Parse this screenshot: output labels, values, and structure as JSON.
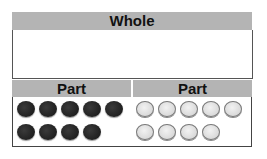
{
  "whole": {
    "label": "Whole"
  },
  "parts": [
    {
      "label": "Part",
      "counter_color": "dark",
      "count": 9
    },
    {
      "label": "Part",
      "counter_color": "light",
      "count": 9
    }
  ],
  "colors": {
    "header": "#b4b4b4",
    "dark_counter": "#1e1e1e",
    "light_counter": "#e0e0e0"
  }
}
